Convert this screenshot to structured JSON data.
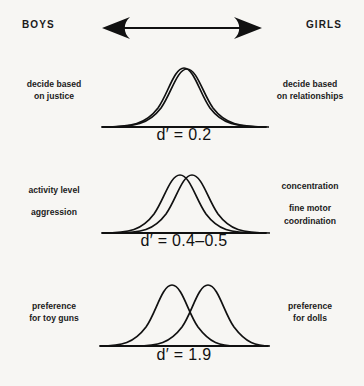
{
  "header": {
    "left_label": "BOYS",
    "right_label": "GIRLS",
    "arrow": "double-headed-horizontal-arrow"
  },
  "panels": [
    {
      "id": "panel-justice",
      "left_lines": [
        "decide based\non justice"
      ],
      "right_lines": [
        "decide based\non relationships"
      ],
      "dprime_label": "d′ = 0.2",
      "dprime_value": 0.2
    },
    {
      "id": "panel-activity",
      "left_lines": [
        "activity level",
        "aggression"
      ],
      "right_lines": [
        "concentration",
        "fine motor\ncoordination"
      ],
      "dprime_label": "d′ = 0.4–0.5",
      "dprime_value": 0.45
    },
    {
      "id": "panel-toys",
      "left_lines": [
        "preference\nfor toy guns"
      ],
      "right_lines": [
        "preference\nfor dolls"
      ],
      "dprime_label": "d′ = 1.9",
      "dprime_value": 1.9
    }
  ],
  "chart_data": {
    "type": "line",
    "title": "",
    "xlabel": "",
    "ylabel": "",
    "series_names": [
      "boys",
      "girls"
    ],
    "distributions": [
      {
        "panel": "decide based on justice / decide based on relationships",
        "d_prime": 0.2,
        "boys_mean": 0.0,
        "girls_mean": 0.2,
        "sd": 1.0,
        "overlap_pct": 92
      },
      {
        "panel": "activity level, aggression / concentration, fine motor coordination",
        "d_prime": 0.45,
        "boys_mean": 0.0,
        "girls_mean": 0.45,
        "sd": 1.0,
        "overlap_pct": 82
      },
      {
        "panel": "preference for toy guns / preference for dolls",
        "d_prime": 1.9,
        "boys_mean": 0.0,
        "girls_mean": 1.9,
        "sd": 1.0,
        "overlap_pct": 34
      }
    ],
    "colors": {
      "curve_stroke": "#111111",
      "background": "#f7f6f3",
      "text": "#1b1b1b"
    }
  }
}
